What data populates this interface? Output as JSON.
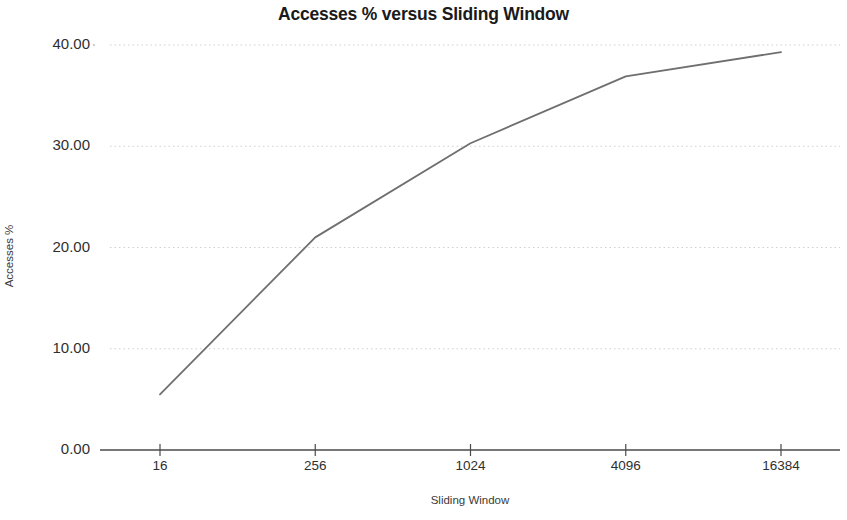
{
  "chart_data": {
    "type": "line",
    "title": "Accesses % versus Sliding Window",
    "xlabel": "Sliding Window",
    "ylabel": "Accesses %",
    "categories": [
      "16",
      "256",
      "1024",
      "4096",
      "16384"
    ],
    "values": [
      5.5,
      21.0,
      30.3,
      36.9,
      39.3
    ],
    "series": [
      {
        "name": "Accesses %",
        "values": [
          5.5,
          21.0,
          30.3,
          36.9,
          39.3
        ]
      }
    ],
    "ylim": [
      0,
      40
    ],
    "ytick_labels": [
      "0.00",
      "10.00",
      "20.00",
      "30.00",
      "40.00"
    ],
    "ytick_values": [
      0,
      10,
      20,
      30,
      40
    ],
    "xtick_labels": [
      "16",
      "256",
      "1024",
      "4096",
      "16384"
    ],
    "grid": true,
    "grid_axis": "y",
    "grid_style": "dotted",
    "legend": false,
    "legend_position": "none",
    "x_scale": "categorical",
    "colors": {
      "line": "#6f6f6f",
      "grid": "#cfcfcf",
      "axis": "#4a4a4a",
      "text": "#2f2f2f",
      "title": "#1a1a1a",
      "background": "#ffffff"
    }
  }
}
